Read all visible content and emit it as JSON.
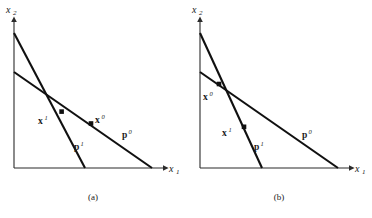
{
  "figure": {
    "type": "diagram",
    "background_color": "#ffffff",
    "line_color": "#101010",
    "axis_color": "#2b2b2b",
    "panels": [
      {
        "id": "a",
        "caption": "(a)",
        "axes": {
          "y_label": "x",
          "y_sub": "2",
          "x_label": "x",
          "x_sub": "1",
          "origin": [
            14,
            168
          ],
          "x_axis_end": [
            170,
            168
          ],
          "y_axis_end": [
            14,
            16
          ]
        },
        "lines": [
          {
            "name": "p0",
            "label": "p",
            "superscript": "0",
            "label_pos": [
              126,
              136
            ],
            "y_intercept": [
              14,
              72
            ],
            "x_intercept": [
              152,
              168
            ],
            "slope_kind": "shallow"
          },
          {
            "name": "p1",
            "label": "p",
            "superscript": "1",
            "label_pos": [
              78,
              148
            ],
            "y_intercept": [
              14,
              33
            ],
            "x_intercept": [
              85,
              168
            ],
            "slope_kind": "steep"
          }
        ],
        "bundles": [
          {
            "name": "x1",
            "label": "x",
            "superscript": "1",
            "marker_pos": [
              62,
              112
            ],
            "label_pos": [
              44,
              122
            ],
            "on_line": "p1"
          },
          {
            "name": "x0",
            "label": "x",
            "superscript": "0",
            "marker_pos": [
              91,
              124
            ],
            "label_pos": [
              95,
              122
            ],
            "on_line": "p0"
          }
        ],
        "intersection": [
          47,
          92
        ]
      },
      {
        "id": "b",
        "caption": "(b)",
        "axes": {
          "y_label": "x",
          "y_sub": "2",
          "x_label": "x",
          "x_sub": "1",
          "origin": [
            14,
            168
          ],
          "x_axis_end": [
            170,
            168
          ],
          "y_axis_end": [
            14,
            16
          ]
        },
        "lines": [
          {
            "name": "p0",
            "label": "p",
            "superscript": "0",
            "label_pos": [
              120,
              136
            ],
            "y_intercept": [
              14,
              72
            ],
            "x_intercept": [
              152,
              168
            ],
            "slope_kind": "shallow"
          },
          {
            "name": "p1",
            "label": "p",
            "superscript": "1",
            "label_pos": [
              72,
              148
            ],
            "y_intercept": [
              14,
              33
            ],
            "x_intercept": [
              76,
              168
            ],
            "slope_kind": "steep"
          }
        ],
        "bundles": [
          {
            "name": "x0",
            "label": "x",
            "superscript": "0",
            "marker_pos": [
              33,
              84
            ],
            "label_pos": [
              22,
              98
            ],
            "on_line": "p0"
          },
          {
            "name": "x1",
            "label": "x",
            "superscript": "1",
            "marker_pos": [
              58,
              127
            ],
            "label_pos": [
              42,
              134
            ],
            "on_line": "p1"
          }
        ],
        "intersection": [
          48,
          96
        ]
      }
    ]
  }
}
